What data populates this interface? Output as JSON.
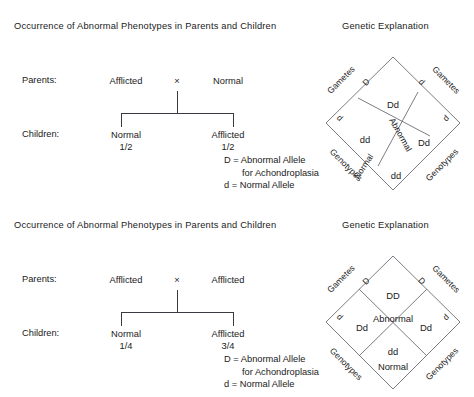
{
  "panels": [
    {
      "title_left": "Occurrence of Abnormal Phenotypes in Parents and Children",
      "title_right": "Genetic Explanation",
      "pedigree": {
        "parents_label": "Parents:",
        "children_label": "Children:",
        "parent_left": "Afflicted",
        "cross_symbol": "×",
        "parent_right": "Normal",
        "child_left": "Normal",
        "child_left_fraction": "1/2",
        "child_right": "Afflicted",
        "child_right_fraction": "1/2"
      },
      "legend": {
        "line1": "D = Abnormal Allele",
        "line2": "for Achondroplasia",
        "line3": "d = Normal Allele"
      },
      "punnett": {
        "gametes_left_label": "Gametes",
        "gametes_right_label": "Gametes",
        "genotypes_left_label": "Genotypes",
        "genotypes_right_label": "Genotypes",
        "allele_top_left": "D",
        "allele_bottom_left": "d",
        "allele_top_right": "d",
        "allele_bottom_right": "d",
        "cell_top": "Dd",
        "cell_left": "dd",
        "cell_right": "Dd",
        "cell_bottom": "dd",
        "phenotype_abnormal": "Abnormal",
        "phenotype_normal": "Normal"
      }
    },
    {
      "title_left": "Occurrence of Abnormal Phenotypes in Parents and Children",
      "title_right": "Genetic Explanation",
      "pedigree": {
        "parents_label": "Parents:",
        "children_label": "Children:",
        "parent_left": "Afflicted",
        "cross_symbol": "×",
        "parent_right": "Afflicted",
        "child_left": "Normal",
        "child_left_fraction": "1/4",
        "child_right": "Afflicted",
        "child_right_fraction": "3/4"
      },
      "legend": {
        "line1": "D = Abnormal Allele",
        "line2": "for Achondroplasia",
        "line3": "d = Normal Allele"
      },
      "punnett": {
        "gametes_left_label": "Gametes",
        "gametes_right_label": "Gametes",
        "genotypes_left_label": "Genotypes",
        "genotypes_right_label": "Genotypes",
        "allele_top_left": "D",
        "allele_bottom_left": "d",
        "allele_top_right": "D",
        "allele_bottom_right": "d",
        "cell_top": "DD",
        "cell_left": "Dd",
        "cell_right": "Dd",
        "cell_bottom": "dd",
        "phenotype_abnormal": "Abnormal",
        "phenotype_normal": "Normal"
      }
    }
  ],
  "colors": {
    "ink": "#1a1a1a",
    "rule": "#3a3a42",
    "diamond_stroke": "#6d6d75",
    "background": "#ffffff"
  }
}
